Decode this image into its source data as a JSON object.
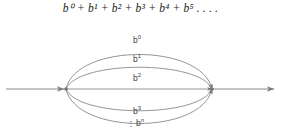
{
  "formula": {
    "text": "b⁰ + b¹ + b² + b³ + b⁴ + b⁵ . . . ."
  },
  "diagram": {
    "type": "state-transition-loop",
    "line_color": "#8a8a8a",
    "arc_color": "#8a8a8a",
    "text_color": "#3a3a3a",
    "background": "#ffffff",
    "nodes": [
      {
        "id": "left-node",
        "x": 66,
        "y": 89
      },
      {
        "id": "right-node",
        "x": 212,
        "y": 89
      }
    ],
    "entry_arrow": {
      "from_x": 6,
      "to_x": 66,
      "y": 89
    },
    "exit_arrow": {
      "from_x": 212,
      "to_x": 272,
      "y": 89
    },
    "arcs": [
      {
        "id": "arc-b0",
        "label_base": "b",
        "label_exp": "0",
        "label_x": 133,
        "label_y": 37,
        "dots": false,
        "curve_y": 45,
        "position": "top-outer"
      },
      {
        "id": "arc-b1",
        "label_base": "b",
        "label_exp": "1",
        "label_x": 133,
        "label_y": 57,
        "dots": false,
        "curve_y": 63,
        "position": "top-inner"
      },
      {
        "id": "arc-b2",
        "label_base": "b",
        "label_exp": "2",
        "label_x": 133,
        "label_y": 75,
        "dots": false,
        "curve_y": 89,
        "position": "middle-straight"
      },
      {
        "id": "arc-b3",
        "label_base": "b",
        "label_exp": "3",
        "label_x": 133,
        "label_y": 109,
        "dots": false,
        "curve_y": 116,
        "position": "bottom-inner"
      },
      {
        "id": "arc-bn",
        "label_base": "b",
        "label_exp": "n",
        "label_x": 128,
        "label_y": 120,
        "dots": true,
        "curve_y": 131,
        "position": "bottom-outer"
      }
    ],
    "vertical_dots": "⋮"
  }
}
